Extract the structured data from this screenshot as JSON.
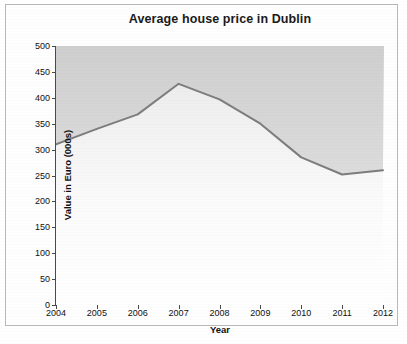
{
  "chart_data": {
    "type": "line",
    "title": "Average house price in Dublin",
    "xlabel": "Year",
    "ylabel": "Value in Euro (000s)",
    "categories": [
      "2004",
      "2005",
      "2006",
      "2007",
      "2008",
      "2009",
      "2010",
      "2011",
      "2012"
    ],
    "x": [
      2004,
      2005,
      2006,
      2007,
      2008,
      2009,
      2010,
      2011,
      2012
    ],
    "values": [
      310,
      340,
      368,
      427,
      397,
      350,
      285,
      252,
      260
    ],
    "series": [
      {
        "name": "Average house price",
        "values": [
          310,
          340,
          368,
          427,
          397,
          350,
          285,
          252,
          260
        ]
      }
    ],
    "xlim": [
      2004,
      2012
    ],
    "ylim": [
      0,
      500
    ],
    "ytick_labels": [
      "0",
      "50",
      "100",
      "150",
      "200",
      "250",
      "300",
      "350",
      "400",
      "450",
      "500"
    ],
    "ytick_values": [
      0,
      50,
      100,
      150,
      200,
      250,
      300,
      350,
      400,
      450,
      500
    ],
    "xtick_labels": [
      "2004",
      "2005",
      "2006",
      "2007",
      "2008",
      "2009",
      "2010",
      "2011",
      "2012"
    ],
    "grid": false,
    "legend": "none",
    "fill": "above-curve-shaded",
    "colors": {
      "line": "#7d7d7d",
      "fill_above": "#d3d3d3",
      "fill_below": "#ffffff",
      "axis": "#4a4a4a",
      "text": "#111111",
      "frame": "#b9b9b9"
    }
  }
}
